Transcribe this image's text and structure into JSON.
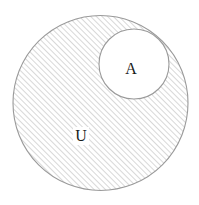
{
  "diagram": {
    "type": "venn-subset",
    "background_color": "#ffffff",
    "shading": {
      "style": "diagonal-hatch",
      "direction": "forward-slash-45",
      "line_color": "#b8b8b8",
      "line_spacing_px": 4,
      "line_width_px": 1.1
    },
    "universal_set": {
      "name": "universal-set-u",
      "label": "U",
      "label_x": 81,
      "label_y": 141,
      "center_x": 100.5,
      "center_y": 103,
      "radius": 87.5,
      "stroke_color": "#9a9a9a",
      "fill": "hatched",
      "label_font_size": 16
    },
    "subset": {
      "name": "set-a",
      "label": "A",
      "label_x": 131,
      "label_y": 74,
      "center_x": 134,
      "center_y": 64,
      "radius": 35,
      "stroke_color": "#9a9a9a",
      "fill": "#ffffff",
      "label_font_size": 16
    },
    "labels": [
      {
        "text": "A",
        "role": "subset-label"
      },
      {
        "text": "U",
        "role": "universal-set-label"
      }
    ]
  }
}
